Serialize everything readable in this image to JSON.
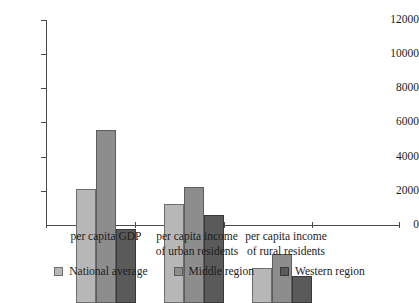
{
  "chart_data": {
    "type": "bar",
    "title": "",
    "subtitle": "",
    "xlabel": "",
    "ylabel": "",
    "categories": [
      "per capita GDP",
      "per capita income\nof urban residents",
      "per capita income\nof rural residents"
    ],
    "series": [
      {
        "name": "National average",
        "color": "#b7b7b7",
        "values": [
          6700,
          5800,
          2050
        ]
      },
      {
        "name": "Middle region",
        "color": "#8d8d8d",
        "values": [
          10150,
          6800,
          2900
        ]
      },
      {
        "name": "Western region",
        "color": "#5a5a5a",
        "values": [
          4350,
          5150,
          1600
        ]
      }
    ],
    "ylim": [
      0,
      12000
    ],
    "ytick_values": [
      0,
      2000,
      4000,
      6000,
      8000,
      10000,
      12000
    ],
    "ytick_labels": [
      "0",
      "2000",
      "4000",
      "6000",
      "8000",
      "10000",
      "12000"
    ],
    "grid": false,
    "legend_position": "bottom"
  },
  "legend": {
    "items": [
      {
        "label": "National average",
        "swatch": "legend-swatch-national-average"
      },
      {
        "label": "Middle region",
        "swatch": "legend-swatch-middle-region"
      },
      {
        "label": "Western region",
        "swatch": "legend-swatch-western-region"
      }
    ]
  },
  "axis": {
    "y_labels": [
      "12000",
      "10000",
      "8000",
      "6000",
      "4000",
      "2000",
      "0"
    ]
  },
  "categories_display": {
    "c0": "per capita GDP",
    "c1": "per capita income\nof urban residents",
    "c2": "per capita income\nof rural residents"
  }
}
